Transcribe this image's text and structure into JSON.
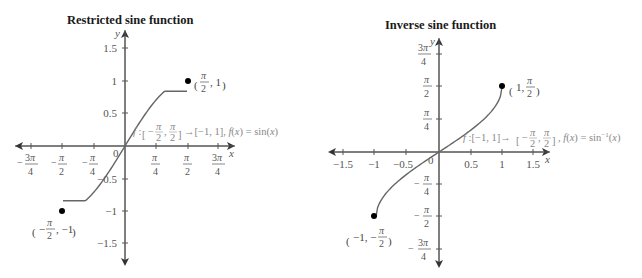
{
  "chart_data": [
    {
      "type": "line",
      "title": "Restricted sine function",
      "xlabel": "x",
      "ylabel": "y",
      "xlim": [
        -2.6,
        2.6
      ],
      "ylim": [
        -1.7,
        1.7
      ],
      "x_ticks": [
        {
          "value": -2.356,
          "label": "-3π/4"
        },
        {
          "value": -1.571,
          "label": "-π/2"
        },
        {
          "value": -0.785,
          "label": "-π/4"
        },
        {
          "value": 0.785,
          "label": "π/4"
        },
        {
          "value": 1.571,
          "label": "π/2"
        },
        {
          "value": 2.356,
          "label": "3π/4"
        }
      ],
      "y_ticks": [
        {
          "value": 1.5,
          "label": "1.5"
        },
        {
          "value": 1,
          "label": "1"
        },
        {
          "value": 0.5,
          "label": "0.5"
        },
        {
          "value": -0.5,
          "label": "-0.5"
        },
        {
          "value": -1,
          "label": "-1"
        },
        {
          "value": -1.5,
          "label": "-1.5"
        }
      ],
      "origin_label": "0",
      "series": [
        {
          "name": "f(x) = sin(x)",
          "function": "sin",
          "domain": [
            -1.5708,
            1.5708
          ]
        }
      ],
      "endpoints": [
        {
          "x": 1.5708,
          "y": 1,
          "label": "(π/2, 1)"
        },
        {
          "x": -1.5708,
          "y": -1,
          "label": "(-π/2, -1)"
        }
      ],
      "annotation": "f : [-π/2, π/2] → [-1, 1], f(x) = sin(x)",
      "grid": false
    },
    {
      "type": "line",
      "title": "Inverse sine function",
      "xlabel": "x",
      "ylabel": "y",
      "xlim": [
        -1.6,
        1.6
      ],
      "ylim": [
        -2.6,
        2.6
      ],
      "x_ticks": [
        {
          "value": -1.5,
          "label": "-1.5"
        },
        {
          "value": -1,
          "label": "-1"
        },
        {
          "value": -0.5,
          "label": "-0.5"
        },
        {
          "value": 0.5,
          "label": "0.5"
        },
        {
          "value": 1,
          "label": "1"
        },
        {
          "value": 1.5,
          "label": "1.5"
        }
      ],
      "y_ticks": [
        {
          "value": 2.356,
          "label": "3π/4"
        },
        {
          "value": 1.571,
          "label": "π/2"
        },
        {
          "value": 0.785,
          "label": "π/4"
        },
        {
          "value": -0.785,
          "label": "-π/4"
        },
        {
          "value": -1.571,
          "label": "-π/2"
        },
        {
          "value": -2.356,
          "label": "-3π/4"
        }
      ],
      "origin_label": "0",
      "series": [
        {
          "name": "f(x) = sin⁻¹(x)",
          "function": "asin",
          "domain": [
            -1,
            1
          ]
        }
      ],
      "endpoints": [
        {
          "x": 1,
          "y": 1.5708,
          "label": "(1, π/2)"
        },
        {
          "x": -1,
          "y": -1.5708,
          "label": "(-1, -π/2)"
        }
      ],
      "annotation": "f : [-1, 1] → [-π/2, π/2], f(x) = sin⁻¹(x)",
      "grid": false
    }
  ],
  "colors": {
    "axis": "#555555",
    "curve": "#666666",
    "point": "#000000",
    "annotation": "#888888"
  }
}
